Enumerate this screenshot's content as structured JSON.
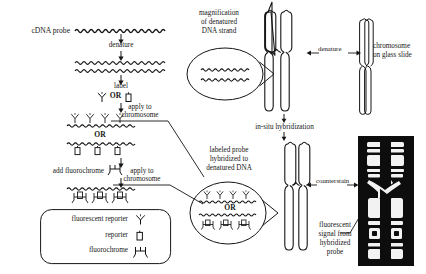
{
  "diagram": {
    "type": "process-flow-diagram"
  },
  "left_column": {
    "probe_label": "cDNA probe",
    "step_denature": "denature",
    "step_label": "label",
    "or_1": "OR",
    "or_2": "OR",
    "step_add_fluorochrome": "add fluorochrome",
    "apply_1_line1": "apply to",
    "apply_1_line2": "chromosome",
    "apply_2_line1": "apply to",
    "apply_2_line2": "chromosome"
  },
  "legend": {
    "items": [
      {
        "label": "fluorescent reporter",
        "icon": "fluorescent-reporter-icon"
      },
      {
        "label": "reporter",
        "icon": "reporter-box-icon"
      },
      {
        "label": "fluorochrome",
        "icon": "fluorochrome-icon"
      }
    ]
  },
  "magnification_callout": {
    "line1": "magnification",
    "line2": "of denatured",
    "line3": "DNA strand"
  },
  "hybridization_callout": {
    "line1": "labeled probe",
    "line2": "hybridized to",
    "line3": "denatured DNA",
    "or": "OR"
  },
  "right_column": {
    "denature_arrow_label": "denature",
    "chromosome_slide_line1": "chromosome",
    "chromosome_slide_line2": "on glass slide",
    "in_situ_hybridization": "in-situ hybridization",
    "counterstain_label": "counterstain",
    "signal_line1": "fluorescent",
    "signal_line2": "signal from",
    "signal_line3": "hybridized",
    "signal_line4": "probe"
  },
  "colors": {
    "ink": "#151515",
    "background": "#ffffff",
    "micrograph_background": "#0d0d0d",
    "micrograph_band": "#f2f2f2"
  }
}
